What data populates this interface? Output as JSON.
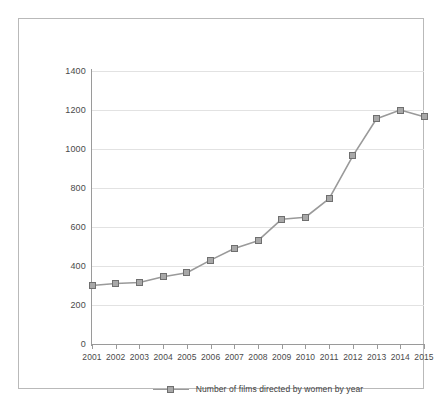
{
  "chart_data": {
    "type": "line",
    "title": "",
    "subtitle": "",
    "xlabel": "",
    "ylabel": "",
    "categories": [
      "2001",
      "2002",
      "2003",
      "2004",
      "2005",
      "2006",
      "2007",
      "2008",
      "2009",
      "2010",
      "2011",
      "2012",
      "2013",
      "2014",
      "2015"
    ],
    "series": [
      {
        "name": "Number of films directed by women by year",
        "values": [
          300,
          310,
          315,
          345,
          365,
          430,
          490,
          530,
          640,
          650,
          745,
          965,
          1155,
          1200,
          1165
        ]
      }
    ],
    "ylim": [
      0,
      1400
    ],
    "yticks": [
      0,
      200,
      400,
      600,
      800,
      1000,
      1200,
      1400
    ],
    "ytick_labels": [
      "0",
      "200",
      "400",
      "600",
      "800",
      "1000",
      "1200",
      "1400"
    ],
    "grid": "horizontal",
    "legend_position": "bottom-center",
    "marker": "square",
    "colors": {
      "line": "#9a9a9a",
      "marker_fill": "#a8a8a8",
      "marker_edge": "#6f6f6f",
      "grid": "#e2e2e2",
      "axis": "#9a9a9a",
      "text": "#4a4a4a",
      "frame": "#b9b9b9",
      "background": "#ffffff"
    }
  },
  "legend": {
    "entries": [
      {
        "label": "Number of films directed by women by year"
      }
    ]
  }
}
